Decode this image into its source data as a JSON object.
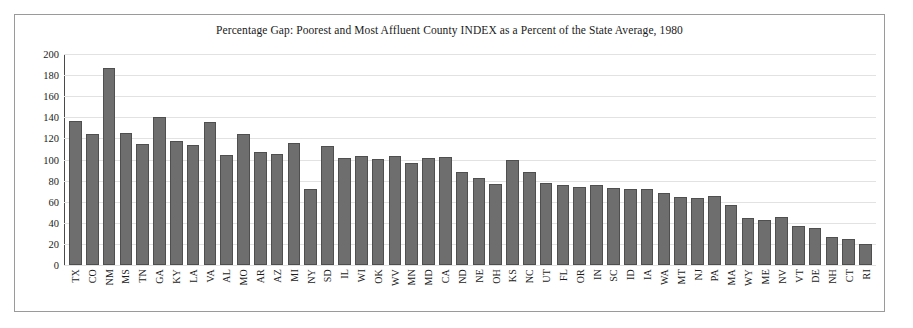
{
  "chart_data": {
    "type": "bar",
    "title": "Percentage Gap: Poorest and Most Affluent County INDEX as a Percent of the State Average, 1980",
    "xlabel": "",
    "ylabel": "",
    "ylim": [
      0,
      200
    ],
    "yticks": [
      200,
      180,
      160,
      140,
      120,
      100,
      80,
      60,
      40,
      20,
      0
    ],
    "grid": true,
    "legend": "none",
    "bar_color": "#6e6e6e",
    "bar_edge_color": "#4f4f4f",
    "categories": [
      "TX",
      "CO",
      "NM",
      "MS",
      "TN",
      "GA",
      "KY",
      "LA",
      "VA",
      "AL",
      "MO",
      "AR",
      "AZ",
      "MI",
      "NY",
      "SD",
      "IL",
      "WI",
      "OK",
      "WV",
      "MN",
      "MD",
      "CA",
      "ND",
      "NE",
      "OH",
      "KS",
      "NC",
      "UT",
      "FL",
      "OR",
      "IN",
      "SC",
      "ID",
      "IA",
      "WA",
      "MT",
      "NJ",
      "PA",
      "MA",
      "WY",
      "ME",
      "NV",
      "VT",
      "DE",
      "NH",
      "CT",
      "RI"
    ],
    "values": [
      137,
      125,
      188,
      126,
      115,
      141,
      118,
      114,
      136,
      105,
      125,
      108,
      106,
      116,
      72,
      113,
      102,
      104,
      101,
      104,
      97,
      102,
      103,
      89,
      83,
      77,
      100,
      89,
      78,
      76,
      74,
      76,
      73,
      72,
      72,
      69,
      65,
      64,
      66,
      57,
      45,
      43,
      46,
      37,
      35,
      27,
      25,
      20
    ]
  }
}
